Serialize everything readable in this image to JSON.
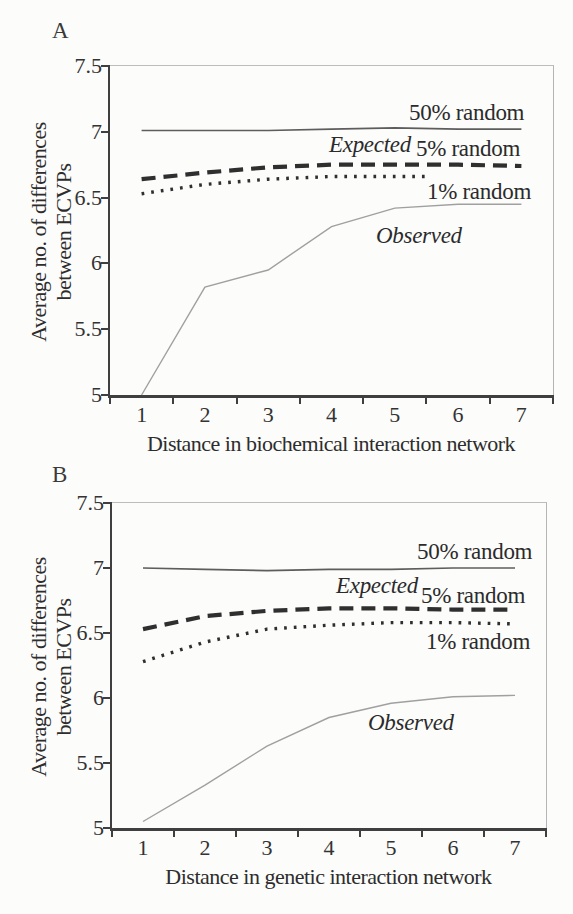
{
  "panels": [
    {
      "letter": "A",
      "expected_label": "Expected"
    },
    {
      "letter": "B",
      "expected_label": "Expected"
    }
  ],
  "chart_data": [
    {
      "type": "line",
      "title": "",
      "xlabel": "Distance in biochemical interaction network",
      "ylabel": "Average no. of differences between ECVPs",
      "ylabel_lines": [
        "Average no. of differences",
        "between ECVPs"
      ],
      "x": [
        1,
        2,
        3,
        4,
        5,
        6,
        7
      ],
      "xlim": [
        0.5,
        7.5
      ],
      "ylim": [
        5,
        7.5
      ],
      "x_ticks": [
        1,
        2,
        3,
        4,
        5,
        6,
        7
      ],
      "y_ticks": [
        7.5,
        7,
        6.5,
        6,
        5.5,
        5
      ],
      "grid": false,
      "legend": "inline-annotations",
      "series": [
        {
          "name": "50% random",
          "style": "solid-thin",
          "values": [
            7.01,
            7.01,
            7.01,
            7.02,
            7.03,
            7.02,
            7.02
          ]
        },
        {
          "name": "5% random",
          "style": "dashed-thick",
          "values": [
            6.64,
            6.69,
            6.73,
            6.75,
            6.75,
            6.75,
            6.74
          ]
        },
        {
          "name": "1% random",
          "style": "dotted",
          "x": [
            1,
            2,
            3,
            4,
            5,
            5.5
          ],
          "values": [
            6.53,
            6.6,
            6.64,
            6.66,
            6.66,
            6.66
          ]
        },
        {
          "name": "Observed",
          "style": "solid-light",
          "values": [
            5.0,
            5.82,
            5.95,
            6.28,
            6.42,
            6.45,
            6.45
          ]
        }
      ]
    },
    {
      "type": "line",
      "title": "",
      "xlabel": "Distance in genetic interaction network",
      "ylabel": "Average no. of differences between ECVPs",
      "ylabel_lines": [
        "Average no. of differences",
        "between ECVPs"
      ],
      "x": [
        1,
        2,
        3,
        4,
        5,
        6,
        7
      ],
      "xlim": [
        0.5,
        7.5
      ],
      "ylim": [
        5,
        7.5
      ],
      "x_ticks": [
        1,
        2,
        3,
        4,
        5,
        6,
        7
      ],
      "y_ticks": [
        7.5,
        7,
        6.5,
        6,
        5.5,
        5
      ],
      "grid": false,
      "legend": "inline-annotations",
      "series": [
        {
          "name": "50% random",
          "style": "solid-thin",
          "values": [
            7.0,
            6.99,
            6.98,
            6.99,
            6.99,
            7.0,
            7.0
          ]
        },
        {
          "name": "5% random",
          "style": "dashed-thick",
          "values": [
            6.53,
            6.63,
            6.67,
            6.69,
            6.69,
            6.68,
            6.68
          ]
        },
        {
          "name": "1% random",
          "style": "dotted",
          "values": [
            6.28,
            6.43,
            6.53,
            6.56,
            6.58,
            6.58,
            6.57
          ]
        },
        {
          "name": "Observed",
          "style": "solid-light",
          "values": [
            5.05,
            5.33,
            5.63,
            5.85,
            5.96,
            6.01,
            6.02
          ]
        }
      ]
    }
  ],
  "style": {
    "line_dark": "#2f2f2f",
    "line_medium": "#5d5d5d",
    "line_light": "#a0a0a0",
    "axis_color": "#3f3f3f",
    "background": "#fcfcfb"
  }
}
